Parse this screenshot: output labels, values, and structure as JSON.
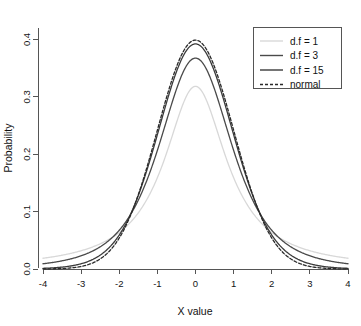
{
  "chart_data": {
    "type": "line",
    "title": "",
    "xlabel": "X value",
    "ylabel": "Probability",
    "xlim": [
      -4,
      4
    ],
    "ylim": [
      0,
      0.42
    ],
    "grid": false,
    "legend_position": "top-right",
    "x_ticks": [
      "-4",
      "-3",
      "-2",
      "-1",
      "0",
      "1",
      "2",
      "3",
      "4"
    ],
    "x_tick_values": [
      -4,
      -3,
      -2,
      -1,
      0,
      1,
      2,
      3,
      4
    ],
    "y_ticks": [
      "0.0",
      "0.1",
      "0.2",
      "0.3",
      "0.4"
    ],
    "y_tick_values": [
      0.0,
      0.1,
      0.2,
      0.3,
      0.4
    ],
    "x": [
      -4,
      -3.5,
      -3,
      -2.5,
      -2,
      -1.5,
      -1,
      -0.5,
      0,
      0.5,
      1,
      1.5,
      2,
      2.5,
      3,
      3.5,
      4
    ],
    "series": [
      {
        "name": "d.f = 1",
        "df": 1,
        "peak": 0.318,
        "color": "#d8d8d8",
        "dash": "none",
        "width": 1.3,
        "values": [
          0.0187,
          0.0241,
          0.0318,
          0.0439,
          0.0637,
          0.0979,
          0.1592,
          0.2546,
          0.3183,
          0.2546,
          0.1592,
          0.0979,
          0.0637,
          0.0439,
          0.0318,
          0.0241,
          0.0187
        ]
      },
      {
        "name": "d.f = 3",
        "df": 3,
        "peak": 0.3675,
        "color": "#4a4a4a",
        "dash": "none",
        "width": 1.3,
        "values": [
          0.0092,
          0.0139,
          0.0229,
          0.0386,
          0.0675,
          0.12,
          0.2067,
          0.3002,
          0.3676,
          0.3002,
          0.2067,
          0.12,
          0.0675,
          0.0386,
          0.0229,
          0.0139,
          0.0092
        ]
      },
      {
        "name": "d.f = 15",
        "df": 15,
        "peak": 0.3914,
        "color": "#3a3a3a",
        "dash": "none",
        "width": 1.3,
        "values": [
          0.0012,
          0.0031,
          0.0077,
          0.0187,
          0.0424,
          0.0874,
          0.1612,
          0.2585,
          0.3914,
          0.2585,
          0.1612,
          0.0874,
          0.0424,
          0.0187,
          0.0077,
          0.0031,
          0.0012
        ]
      },
      {
        "name": "normal",
        "df": null,
        "peak": 0.3989,
        "color": "#2a2a2a",
        "dash": "3,2",
        "width": 1.3,
        "values": [
          0.0001,
          0.0009,
          0.0044,
          0.0175,
          0.054,
          0.1295,
          0.242,
          0.3521,
          0.3989,
          0.3521,
          0.242,
          0.1295,
          0.054,
          0.0175,
          0.0044,
          0.0009,
          0.0001
        ]
      }
    ]
  },
  "legend": {
    "entries": [
      {
        "label": "d.f = 1"
      },
      {
        "label": "d.f = 3"
      },
      {
        "label": "d.f = 15"
      },
      {
        "label": "normal"
      }
    ]
  },
  "axes": {
    "x_title": "X value",
    "y_title": "Probability"
  }
}
